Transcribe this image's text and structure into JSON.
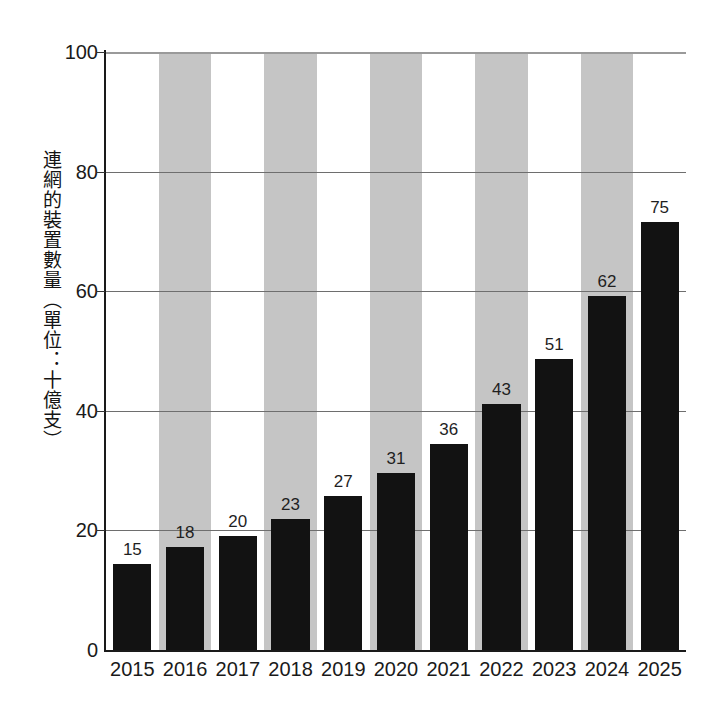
{
  "chart_data": {
    "type": "bar",
    "title": "",
    "subtitle": "",
    "xlabel": "",
    "ylabel": "連網的裝置數量（單位：十億支）",
    "categories": [
      "2015",
      "2016",
      "2017",
      "2018",
      "2019",
      "2020",
      "2021",
      "2022",
      "2023",
      "2024",
      "2025"
    ],
    "values": [
      15,
      18,
      20,
      23,
      27,
      31,
      36,
      43,
      51,
      62,
      75
    ],
    "data_labels": [
      "15",
      "18",
      "20",
      "23",
      "27",
      "31",
      "36",
      "43",
      "51",
      "62",
      "75"
    ],
    "ylim": [
      0,
      100
    ],
    "y_ticks": [
      0,
      20,
      40,
      60,
      80,
      100
    ],
    "y_tick_labels": [
      "0",
      "20",
      "40",
      "60",
      "80",
      "100"
    ],
    "grid": true,
    "grid_axis": "y",
    "legend": null,
    "legend_position": "none",
    "bar_color": "#121212",
    "band_color": "#c5c5c5",
    "gridline_color": "#6e6e6e",
    "axis_color": "#1a1a1a",
    "banded_categories": [
      "2016",
      "2018",
      "2020",
      "2022",
      "2024"
    ],
    "background": "#ffffff"
  }
}
